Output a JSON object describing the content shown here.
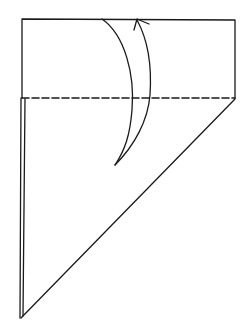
{
  "diagram": {
    "type": "origami-fold-instruction",
    "colors": {
      "stroke": "#1a1a1a",
      "background": "#ffffff"
    },
    "elements": {
      "top_flap": "rectangle flap above fold line",
      "fold_line": "dashed valley fold line",
      "lower_triangle": "right triangle paper layer",
      "fold_arrow": "curved arrow indicating fold up"
    }
  }
}
